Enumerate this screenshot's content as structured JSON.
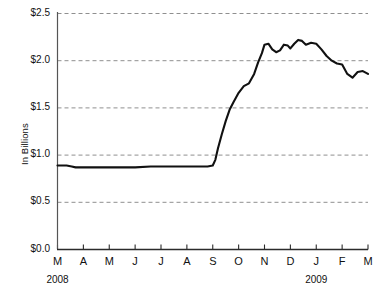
{
  "chart_data": {
    "type": "line",
    "title": "",
    "xlabel": "",
    "ylabel": "In Billions",
    "ylim": [
      0.0,
      2.65
    ],
    "yticks": [
      0.0,
      0.5,
      1.0,
      1.5,
      2.0,
      2.5
    ],
    "ytick_labels": [
      "$0.0",
      "$0.5",
      "$1.0",
      "$1.5",
      "$2.0",
      "$2.5"
    ],
    "grid": true,
    "grid_style": "dashed",
    "legend": "none",
    "categories": [
      "M",
      "A",
      "M",
      "J",
      "J",
      "A",
      "S",
      "O",
      "N",
      "D",
      "J",
      "F",
      "M"
    ],
    "category_months": [
      "Mar",
      "Apr",
      "May",
      "Jun",
      "Jul",
      "Aug",
      "Sep",
      "Oct",
      "Nov",
      "Dec",
      "Jan",
      "Feb",
      "Mar"
    ],
    "year_labels": [
      {
        "text": "2008",
        "at_category_index": 0
      },
      {
        "text": "2009",
        "at_category_index": 10
      }
    ],
    "series": [
      {
        "name": "value",
        "color": "#111111",
        "x": [
          0.0,
          0.35,
          0.55,
          0.7,
          1.0,
          1.4,
          2.0,
          2.6,
          3.0,
          3.6,
          4.0,
          4.6,
          5.0,
          5.4,
          5.8,
          6.0,
          6.1,
          6.2,
          6.35,
          6.5,
          6.65,
          6.8,
          7.0,
          7.2,
          7.4,
          7.6,
          7.75,
          7.9,
          8.0,
          8.15,
          8.3,
          8.45,
          8.6,
          8.75,
          8.9,
          9.0,
          9.15,
          9.3,
          9.45,
          9.6,
          9.8,
          10.0,
          10.2,
          10.4,
          10.6,
          10.8,
          11.0,
          11.2,
          11.4,
          11.6,
          11.8,
          12.0
        ],
        "values": [
          0.89,
          0.89,
          0.88,
          0.87,
          0.87,
          0.87,
          0.87,
          0.87,
          0.87,
          0.88,
          0.88,
          0.88,
          0.88,
          0.88,
          0.88,
          0.89,
          0.95,
          1.07,
          1.22,
          1.36,
          1.48,
          1.56,
          1.66,
          1.73,
          1.76,
          1.86,
          1.98,
          2.08,
          2.17,
          2.18,
          2.12,
          2.09,
          2.11,
          2.17,
          2.16,
          2.13,
          2.18,
          2.22,
          2.21,
          2.17,
          2.19,
          2.18,
          2.12,
          2.05,
          2.0,
          1.97,
          1.96,
          1.86,
          1.82,
          1.88,
          1.89,
          1.86
        ],
        "notable_points": {
          "start": 0.89,
          "plateau_low": 0.87,
          "rise_start_month": "Sep",
          "peak": 2.22,
          "peak_month": "Dec",
          "dip_after_peak": 1.82,
          "end": 1.86
        }
      }
    ]
  },
  "axes": {
    "y_axis_line_color": "#555555",
    "x_axis_line_color": "#333333",
    "gridline_color": "#8f8f8f"
  }
}
